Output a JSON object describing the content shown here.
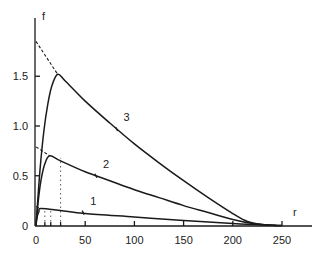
{
  "chart_data": {
    "type": "line",
    "title": "",
    "xlabel": "r",
    "ylabel": "f",
    "xlim": [
      0,
      280
    ],
    "ylim": [
      0,
      1.9
    ],
    "grid": false,
    "legend": "none (curves labeled inline 1, 2, 3)",
    "x_ticks": [
      0,
      50,
      100,
      150,
      200,
      250
    ],
    "x_tick_labels": [
      "0",
      "50",
      "100",
      "150",
      "200",
      "250"
    ],
    "y_ticks": [
      0,
      0.5,
      1.0,
      1.5
    ],
    "y_tick_labels": [
      "0",
      "0.5",
      "1.0",
      "1.5"
    ],
    "series": [
      {
        "name": "1",
        "peak": {
          "r": 5,
          "f": 0.17
        },
        "extrapolated_intercept_f": 0.19,
        "label_at": {
          "r": 53,
          "f": 0.21
        },
        "points": [
          [
            0,
            0
          ],
          [
            1,
            0.08
          ],
          [
            3,
            0.14
          ],
          [
            5,
            0.17
          ],
          [
            25,
            0.15
          ],
          [
            50,
            0.12
          ],
          [
            100,
            0.085
          ],
          [
            150,
            0.05
          ],
          [
            200,
            0.02
          ],
          [
            240,
            0.002
          ],
          [
            250,
            0
          ]
        ]
      },
      {
        "name": "2",
        "peak": {
          "r": 14,
          "f": 0.7
        },
        "extrapolated_intercept_f": 0.79,
        "label_at": {
          "r": 66,
          "f": 0.58
        },
        "points": [
          [
            0,
            0
          ],
          [
            2,
            0.22
          ],
          [
            5,
            0.45
          ],
          [
            9,
            0.62
          ],
          [
            14,
            0.7
          ],
          [
            25,
            0.65
          ],
          [
            50,
            0.54
          ],
          [
            75,
            0.45
          ],
          [
            100,
            0.36
          ],
          [
            125,
            0.28
          ],
          [
            150,
            0.2
          ],
          [
            175,
            0.13
          ],
          [
            200,
            0.06
          ],
          [
            220,
            0.02
          ],
          [
            240,
            0.003
          ],
          [
            250,
            0
          ]
        ]
      },
      {
        "name": "3",
        "peak": {
          "r": 22,
          "f": 1.52
        },
        "extrapolated_intercept_f": 1.85,
        "label_at": {
          "r": 87,
          "f": 1.05
        },
        "points": [
          [
            0,
            0
          ],
          [
            4,
            0.55
          ],
          [
            8,
            0.95
          ],
          [
            12,
            1.22
          ],
          [
            16,
            1.4
          ],
          [
            22,
            1.52
          ],
          [
            30,
            1.45
          ],
          [
            50,
            1.25
          ],
          [
            75,
            1.03
          ],
          [
            100,
            0.82
          ],
          [
            125,
            0.63
          ],
          [
            150,
            0.45
          ],
          [
            175,
            0.28
          ],
          [
            200,
            0.12
          ],
          [
            215,
            0.04
          ],
          [
            230,
            0.01
          ],
          [
            245,
            0
          ]
        ]
      }
    ],
    "annotations": [
      {
        "type": "dashed_tangent",
        "series": "3",
        "from": [
          0,
          1.85
        ],
        "to": [
          22,
          1.52
        ]
      },
      {
        "type": "dashed_tangent",
        "series": "2",
        "from": [
          0,
          0.79
        ],
        "to": [
          14,
          0.7
        ]
      },
      {
        "type": "dashed_tangent",
        "series": "1",
        "from": [
          0,
          0.19
        ],
        "to": [
          5,
          0.17
        ]
      },
      {
        "type": "dotted_vertical",
        "r": 9
      },
      {
        "type": "dotted_vertical",
        "r": 15
      },
      {
        "type": "dotted_vertical",
        "r": 25
      }
    ]
  },
  "axes": {
    "x_label": "r",
    "y_label": "f"
  },
  "curve_labels": [
    "1",
    "2",
    "3"
  ]
}
